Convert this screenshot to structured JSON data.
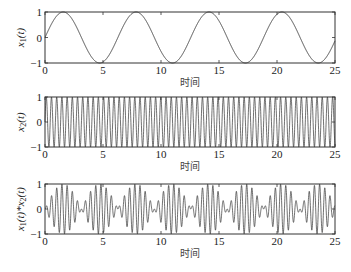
{
  "chart_data": [
    {
      "type": "line",
      "title": "",
      "xlabel": "时间",
      "ylabel": "x1(t)",
      "ylabel_parts": {
        "base": "x",
        "sub": "1",
        "tail": "(t)"
      },
      "xlim": [
        0,
        25
      ],
      "ylim": [
        -1,
        1
      ],
      "xticks": [
        "0",
        "5",
        "10",
        "15",
        "20",
        "25"
      ],
      "yticks": [
        "-1",
        "0",
        "1"
      ],
      "function": "sin(t)",
      "series": [
        {
          "name": "x1(t)",
          "expr": "sin",
          "freq": 1
        }
      ],
      "grid": false
    },
    {
      "type": "line",
      "title": "",
      "xlabel": "时间",
      "ylabel": "x2(t)",
      "ylabel_parts": {
        "base": "x",
        "sub": "2",
        "tail": "(t)"
      },
      "xlim": [
        0,
        25
      ],
      "ylim": [
        -1,
        1
      ],
      "xticks": [
        "0",
        "5",
        "10",
        "15",
        "20",
        "25"
      ],
      "yticks": [
        "-1",
        "0",
        "1"
      ],
      "function": "sin(14t)",
      "series": [
        {
          "name": "x2(t)",
          "expr": "sin",
          "freq": 14
        }
      ],
      "grid": false
    },
    {
      "type": "line",
      "title": "",
      "xlabel": "时间",
      "ylabel": "x1(t)*x2(t)",
      "ylabel_parts": {
        "base": "x",
        "sub": "1",
        "tail": "(t)*x",
        "sub2": "2",
        "tail2": "(t)"
      },
      "xlim": [
        0,
        25
      ],
      "ylim": [
        -1,
        1
      ],
      "xticks": [
        "0",
        "5",
        "10",
        "15",
        "20",
        "25"
      ],
      "yticks": [
        "-1",
        "0",
        "1"
      ],
      "function": "sin(t)*sin(14t)",
      "series": [
        {
          "name": "x1(t)*x2(t)",
          "expr": "product",
          "freq": 14
        }
      ],
      "grid": false
    }
  ],
  "layout": {
    "axes_left": 45,
    "axes_right": 335,
    "panels": [
      {
        "top": 12,
        "bottom": 63
      },
      {
        "top": 97,
        "bottom": 147
      },
      {
        "top": 184,
        "bottom": 234
      }
    ]
  }
}
